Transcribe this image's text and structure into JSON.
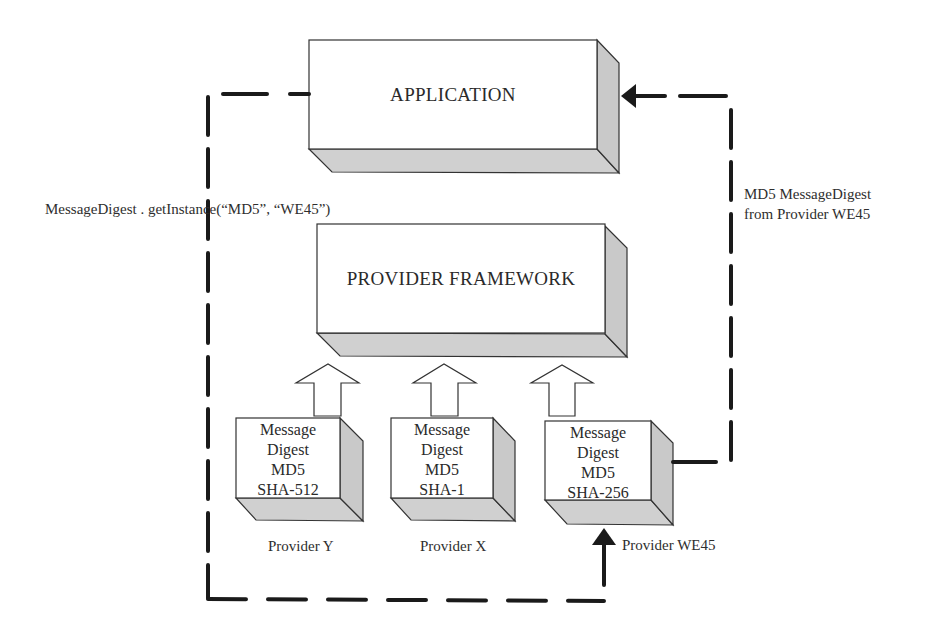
{
  "diagram": {
    "application_box": {
      "label": "APPLICATION"
    },
    "framework_box": {
      "label": "PROVIDER FRAMEWORK"
    },
    "providers": [
      {
        "name": "Provider Y",
        "lines": [
          "Message",
          "Digest",
          "MD5",
          "SHA-512"
        ]
      },
      {
        "name": "Provider X",
        "lines": [
          "Message",
          "Digest",
          "MD5",
          "SHA-1"
        ]
      },
      {
        "name": "Provider WE45",
        "lines": [
          "Message",
          "Digest",
          "MD5",
          "SHA-256"
        ]
      }
    ],
    "request_label": "MessageDigest . getInstance(“MD5”, “WE45”)",
    "response_label": [
      "MD5 MessageDigest",
      "from Provider WE45"
    ],
    "colors": {
      "face": "#ffffff",
      "side": "#cfcfcf",
      "outline": "#333333",
      "dash": "#1a1a1a"
    }
  }
}
